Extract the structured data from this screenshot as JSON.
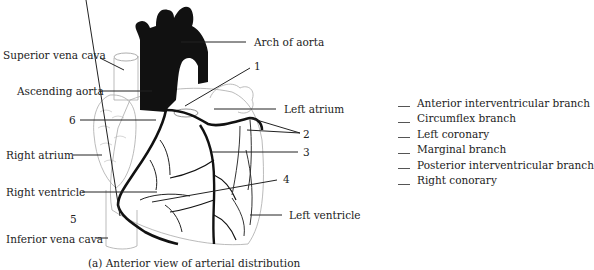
{
  "figure": {
    "caption": "(a) Anterior view of arterial distribution"
  },
  "labels": {
    "superior_vena_cava": "Superior vena cava",
    "ascending_aorta": "Ascending aorta",
    "arch_of_aorta": "Arch of aorta",
    "left_atrium": "Left atrium",
    "right_atrium": "Right atrium",
    "right_ventricle": "Right ventricle",
    "left_ventricle": "Left ventricle",
    "inferior_vena_cava": "Inferior vena cava"
  },
  "numbers": {
    "n1": "1",
    "n2": "2",
    "n3": "3",
    "n4": "4",
    "n5": "5",
    "n6": "6"
  },
  "answer_options": [
    "Anterior interventricular branch",
    "Circumflex branch",
    "Left coronary",
    "Marginal branch",
    "Posterior interventricular branch",
    "Right conorary"
  ]
}
